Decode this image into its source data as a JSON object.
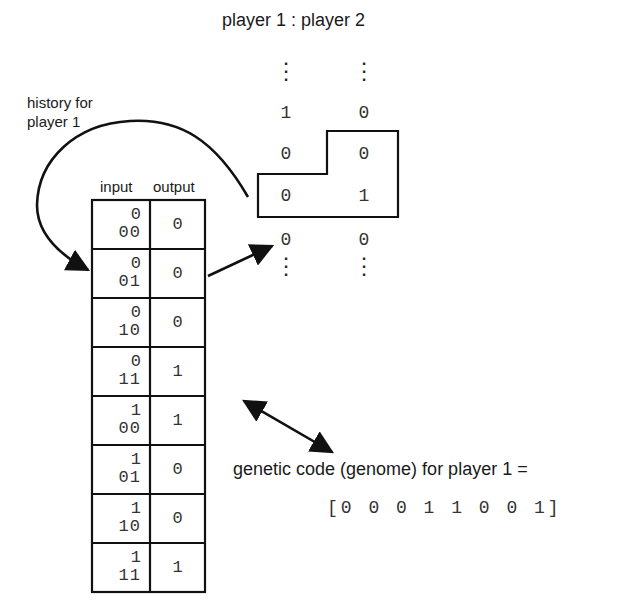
{
  "title": "player 1 : player 2",
  "history_label": {
    "line1": "history for",
    "line2": "player 1"
  },
  "history_sequence": {
    "ellipsis": "⋮",
    "rows": [
      {
        "player1": "1",
        "player2": "0"
      },
      {
        "player1": "0",
        "player2": "0"
      },
      {
        "player1": "0",
        "player2": "1"
      },
      {
        "player1": "0",
        "player2": "0"
      }
    ],
    "highlighted_rows": [
      1,
      2
    ]
  },
  "lookup_table": {
    "headers": {
      "input": "input",
      "output": "output"
    },
    "rows": [
      {
        "input_top": "0",
        "input_bottom": "00",
        "output": "0"
      },
      {
        "input_top": "0",
        "input_bottom": "01",
        "output": "0"
      },
      {
        "input_top": "0",
        "input_bottom": "10",
        "output": "0"
      },
      {
        "input_top": "0",
        "input_bottom": "11",
        "output": "1"
      },
      {
        "input_top": "1",
        "input_bottom": "00",
        "output": "1"
      },
      {
        "input_top": "1",
        "input_bottom": "01",
        "output": "0"
      },
      {
        "input_top": "1",
        "input_bottom": "10",
        "output": "0"
      },
      {
        "input_top": "1",
        "input_bottom": "11",
        "output": "1"
      }
    ]
  },
  "genome": {
    "label": "genetic code (genome) for player 1 =",
    "code": "[0 0 0 1 1 0 0 1]"
  },
  "colors": {
    "ink": "#1a1a1a",
    "background": "#ffffff"
  }
}
